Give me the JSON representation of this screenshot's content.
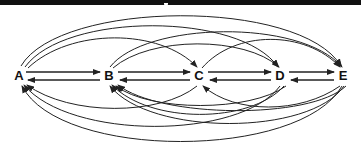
{
  "diagram": {
    "type": "complete-directed-graph",
    "nodes": [
      {
        "id": "A",
        "label": "A",
        "x": 19,
        "y": 76
      },
      {
        "id": "B",
        "label": "B",
        "x": 109,
        "y": 76
      },
      {
        "id": "C",
        "label": "C",
        "x": 199,
        "y": 76
      },
      {
        "id": "D",
        "label": "D",
        "x": 280,
        "y": 76
      },
      {
        "id": "E",
        "label": "E",
        "x": 343,
        "y": 76
      }
    ],
    "edges_forward": [
      [
        "A",
        "B"
      ],
      [
        "B",
        "C"
      ],
      [
        "C",
        "D"
      ],
      [
        "D",
        "E"
      ],
      [
        "A",
        "C"
      ],
      [
        "A",
        "D"
      ],
      [
        "A",
        "E"
      ],
      [
        "B",
        "D"
      ],
      [
        "B",
        "E"
      ],
      [
        "C",
        "E"
      ]
    ],
    "edges_backward": [
      [
        "B",
        "A"
      ],
      [
        "C",
        "B"
      ],
      [
        "D",
        "C"
      ],
      [
        "E",
        "D"
      ],
      [
        "C",
        "A"
      ],
      [
        "D",
        "A"
      ],
      [
        "E",
        "A"
      ],
      [
        "D",
        "B"
      ],
      [
        "E",
        "B"
      ],
      [
        "E",
        "C"
      ]
    ],
    "colors": {
      "line": "#222222",
      "background": "#ffffff",
      "topbar": "#111111"
    }
  }
}
